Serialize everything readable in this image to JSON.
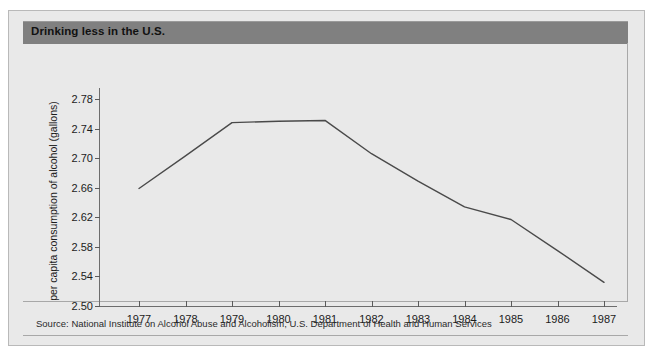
{
  "header": {
    "title": "Drinking less in the U.S."
  },
  "footer": {
    "source": "Source:  National Institute on Alcohol Abuse and Alcoholism, U.S. Department of Health and Human Services"
  },
  "colors": {
    "header_bar": "#808080",
    "card_background": "#e9e9e9",
    "line": "#4a4a4a",
    "axis": "#6d6d6d"
  },
  "chart_data": {
    "type": "line",
    "title": "Drinking less in the U.S.",
    "xlabel": "",
    "ylabel": "per capita consumption of alcohol (gallons)",
    "categories": [
      1977,
      1978,
      1979,
      1980,
      1981,
      1982,
      1983,
      1984,
      1985,
      1986,
      1987
    ],
    "x_tick_labels": [
      "1977",
      "1978",
      "1979",
      "1980",
      "1981",
      "1982",
      "1983",
      "1984",
      "1985",
      "1986",
      "1987"
    ],
    "y_tick_labels": [
      "2.78",
      "2.74",
      "2.70",
      "2.66",
      "2.62",
      "2.58",
      "2.54",
      "2.50"
    ],
    "y_ticks": [
      2.78,
      2.74,
      2.7,
      2.66,
      2.62,
      2.58,
      2.54,
      2.5
    ],
    "ylim": [
      2.5,
      2.8
    ],
    "xlim": [
      1977,
      1987
    ],
    "grid": false,
    "legend": false,
    "series": [
      {
        "name": "per capita consumption of alcohol (gallons)",
        "values": [
          2.659,
          2.703,
          2.748,
          2.75,
          2.751,
          2.706,
          2.669,
          2.634,
          2.617,
          2.575,
          2.532
        ]
      }
    ]
  }
}
